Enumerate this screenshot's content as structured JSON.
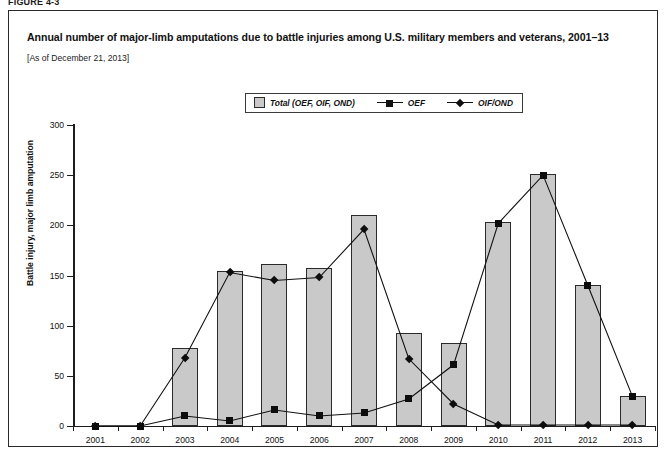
{
  "figure_label": "FIGURE 4-3",
  "title": "Annual number of major-limb amputations due to battle injuries among U.S. military members and veterans, 2001–13",
  "subtitle": "[As of December 21, 2013]",
  "legend": {
    "position": "top-center",
    "items": [
      {
        "label": "Total (OEF, OIF, OND)",
        "marker": "filled-square-swatch",
        "color": "#c9c9c9"
      },
      {
        "label": "OEF",
        "marker": "square-line",
        "color": "#0d0d0d"
      },
      {
        "label": "OIF/OND",
        "marker": "diamond-line",
        "color": "#0d0d0d"
      }
    ]
  },
  "chart_data": {
    "type": "bar",
    "title": "Annual number of major-limb amputations due to battle injuries among U.S. military members and veterans, 2001–13",
    "subtitle": "[As of December 21, 2013]",
    "xlabel": "",
    "ylabel": "Battle injury, major limb amputation",
    "categories": [
      "2001",
      "2002",
      "2003",
      "2004",
      "2005",
      "2006",
      "2007",
      "2008",
      "2009",
      "2010",
      "2011",
      "2012",
      "2013"
    ],
    "ylim": [
      0,
      300
    ],
    "yticks": [
      0,
      50,
      100,
      150,
      200,
      250,
      300
    ],
    "grid": false,
    "series": [
      {
        "name": "Total (OEF, OIF, OND)",
        "type": "bar",
        "values": [
          0,
          0,
          78,
          154,
          161,
          157,
          210,
          93,
          83,
          203,
          251,
          141,
          30
        ]
      },
      {
        "name": "OEF",
        "type": "line",
        "values": [
          0,
          0,
          10,
          5,
          16,
          10,
          13,
          27,
          61,
          202,
          250,
          140,
          29
        ]
      },
      {
        "name": "OIF/OND",
        "type": "line",
        "values": [
          0,
          0,
          68,
          153,
          145,
          148,
          196,
          67,
          22,
          1,
          1,
          1,
          1
        ]
      }
    ]
  }
}
